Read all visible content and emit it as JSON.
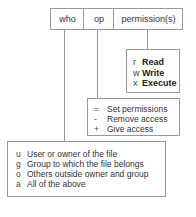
{
  "header": {
    "cells": [
      "who",
      "op",
      "permission(s)"
    ]
  },
  "permissions_box": {
    "items": [
      {
        "key": "r",
        "label": "Read"
      },
      {
        "key": "w",
        "label": "Write"
      },
      {
        "key": "x",
        "label": "Execute"
      }
    ]
  },
  "op_box": {
    "items": [
      {
        "key": "=",
        "label": "Set permissions"
      },
      {
        "key": "-",
        "label": "Remove access"
      },
      {
        "key": "+",
        "label": "Give access"
      }
    ]
  },
  "who_box": {
    "items": [
      {
        "key": "u",
        "label": "User or owner of the file"
      },
      {
        "key": "g",
        "label": "Group to which the file belongs"
      },
      {
        "key": "o",
        "label": "Others outside owner and group"
      },
      {
        "key": "a",
        "label": "All of the above"
      }
    ]
  },
  "colors": {
    "border": "#999999",
    "text": "#333333"
  }
}
